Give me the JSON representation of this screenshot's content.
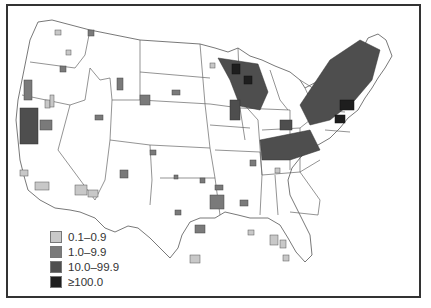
{
  "map": {
    "title": "",
    "region": "United States (contiguous), county-level",
    "legend": {
      "items": [
        {
          "label": "0.1–0.9",
          "color": "#c8c8c8"
        },
        {
          "label": "1.0–9.9",
          "color": "#7a7a7a"
        },
        {
          "label": "10.0–99.9",
          "color": "#4e4e4e"
        },
        {
          "label": "≥100.0",
          "color": "#1e1e1e"
        }
      ]
    }
  }
}
